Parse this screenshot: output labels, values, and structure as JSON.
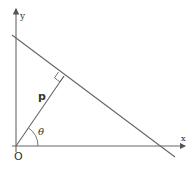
{
  "diagram": {
    "labels": {
      "y_axis": "y",
      "x_axis": "x",
      "origin": "O",
      "perpendicular": "p",
      "angle": "θ"
    },
    "colors": {
      "lines": "#555555",
      "text": "#333333",
      "background": "#ffffff"
    }
  }
}
